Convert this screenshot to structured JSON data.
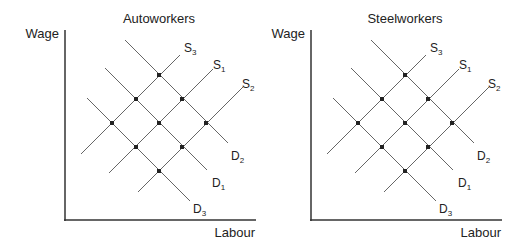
{
  "panels": [
    {
      "title": "Autoworkers",
      "y_label": "Wage",
      "x_label": "Labour",
      "supply_labels": [
        {
          "main": "S",
          "sub": "3"
        },
        {
          "main": "S",
          "sub": "1"
        },
        {
          "main": "S",
          "sub": "2"
        }
      ],
      "demand_labels": [
        {
          "main": "D",
          "sub": "2"
        },
        {
          "main": "D",
          "sub": "1"
        },
        {
          "main": "D",
          "sub": "3"
        }
      ]
    },
    {
      "title": "Steelworkers",
      "y_label": "Wage",
      "x_label": "Labour",
      "supply_labels": [
        {
          "main": "S",
          "sub": "3"
        },
        {
          "main": "S",
          "sub": "1"
        },
        {
          "main": "S",
          "sub": "2"
        }
      ],
      "demand_labels": [
        {
          "main": "D",
          "sub": "2"
        },
        {
          "main": "D",
          "sub": "1"
        },
        {
          "main": "D",
          "sub": "3"
        }
      ]
    }
  ],
  "colors": {
    "line": "#555555",
    "axis": "#333333",
    "dot": "#222222",
    "text": "#222222"
  }
}
